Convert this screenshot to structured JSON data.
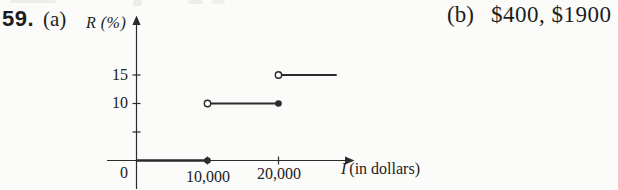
{
  "page": {
    "problem_number": "59.",
    "part_a_label": "(a)",
    "part_b_label": "(b)",
    "part_b_answer": "$400, $1900"
  },
  "chart_data": {
    "type": "line",
    "subtype": "step-function",
    "title": "",
    "xlabel": "I (in dollars)",
    "xlabel_symbol": "I",
    "xlabel_unit": "(in dollars)",
    "ylabel": "R (%)",
    "xlim": [
      0,
      30000
    ],
    "ylim": [
      0,
      20
    ],
    "grid": false,
    "legend": "none",
    "xticks": [
      {
        "value": 0,
        "label": "0"
      },
      {
        "value": 10000,
        "label": "10,000"
      },
      {
        "value": 20000,
        "label": "20,000"
      }
    ],
    "yticks": [
      {
        "value": 5,
        "label": ""
      },
      {
        "value": 10,
        "label": "10"
      },
      {
        "value": 15,
        "label": "15"
      }
    ],
    "segments": [
      {
        "x1": 0,
        "y1": 0,
        "x2": 10000,
        "y2": 0,
        "left_endpoint": "none",
        "right_endpoint": "closed",
        "bold": true
      },
      {
        "x1": 10000,
        "y1": 10,
        "x2": 20000,
        "y2": 10,
        "left_endpoint": "open",
        "right_endpoint": "closed",
        "bold": false
      },
      {
        "x1": 20000,
        "y1": 15,
        "x2": 28200,
        "y2": 15,
        "left_endpoint": "open",
        "right_endpoint": "none",
        "bold": false
      }
    ]
  },
  "colors": {
    "ink": "#1d1d1d",
    "line": "#2b2b2b",
    "background": "#fbfbf9"
  }
}
